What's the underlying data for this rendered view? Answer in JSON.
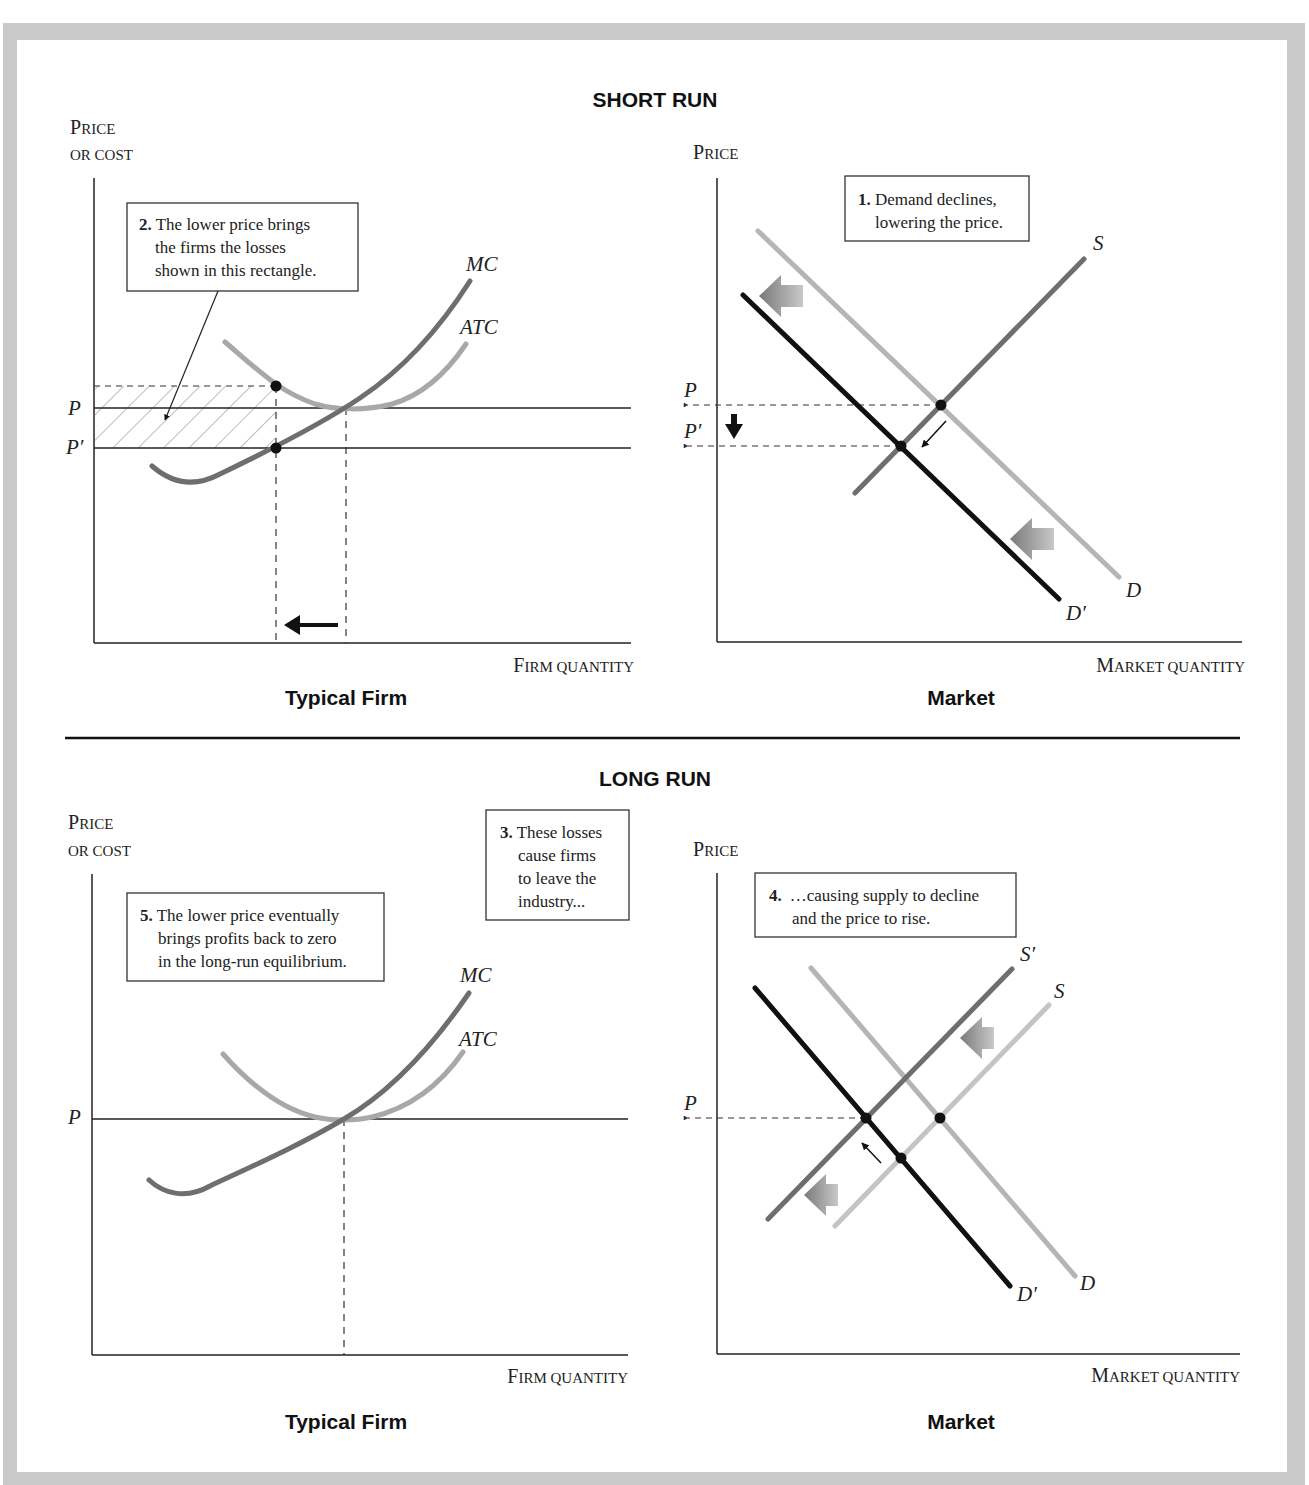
{
  "short_run": {
    "title": "SHORT RUN",
    "firm": {
      "caption": "Typical Firm",
      "y_axis_label_1_cap": "P",
      "y_axis_label_1_rest": "RICE",
      "y_axis_label_2": "OR COST",
      "x_axis_label_cap": "F",
      "x_axis_label_rest": "IRM QUANTITY",
      "price_labels": [
        "P",
        "P′"
      ],
      "curves": [
        "MC",
        "ATC"
      ],
      "note": {
        "number": "2.",
        "lines": [
          "The lower price brings",
          "the firms the losses",
          "shown in this rectangle."
        ]
      },
      "arrow": "arrow-left-icon"
    },
    "market": {
      "caption": "Market",
      "y_axis_label_cap": "P",
      "y_axis_label_rest": "RICE",
      "x_axis_label_cap_1": "M",
      "x_axis_label_rest": "ARKET QUANTITY",
      "price_labels": [
        "P",
        "P′"
      ],
      "curves": [
        "S",
        "D",
        "D′"
      ],
      "note": {
        "number": "1.",
        "lines": [
          "Demand declines,",
          "lowering the price."
        ]
      }
    }
  },
  "long_run": {
    "title": "LONG RUN",
    "firm": {
      "caption": "Typical Firm",
      "y_axis_label_1_cap": "P",
      "y_axis_label_1_rest": "RICE",
      "y_axis_label_2": "OR COST",
      "x_axis_label_cap": "F",
      "x_axis_label_rest": "IRM QUANTITY",
      "price_labels": [
        "P"
      ],
      "curves": [
        "MC",
        "ATC"
      ],
      "note": {
        "number": "5.",
        "lines": [
          "The lower price eventually",
          "brings profits back to zero",
          "in the long-run equilibrium."
        ]
      }
    },
    "middle_note": {
      "number": "3.",
      "lines": [
        "These losses",
        "cause firms",
        "to leave the",
        "industry..."
      ]
    },
    "market": {
      "caption": "Market",
      "y_axis_label_cap": "P",
      "y_axis_label_rest": "RICE",
      "x_axis_label_cap_1": "M",
      "x_axis_label_rest": "ARKET QUANTITY",
      "price_labels": [
        "P"
      ],
      "curves": [
        "S′",
        "S",
        "D",
        "D′"
      ],
      "note": {
        "number": "4.",
        "lines": [
          "…causing supply to decline",
          "and the price to rise."
        ]
      }
    }
  },
  "colors": {
    "frame": "#c9c9c9",
    "mc": "#6e6e6e",
    "atc": "#a8a8a8",
    "demand_old": "#b5b5b5",
    "demand_new": "#111111",
    "supply": "#6e6e6e",
    "supply_new_lr": "#6e6e6e",
    "supply_old_lr": "#c4c4c4"
  }
}
